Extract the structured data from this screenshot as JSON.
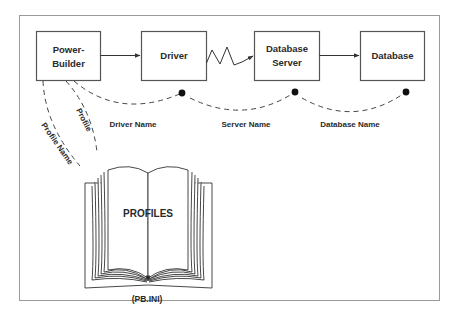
{
  "diagram": {
    "nodes": [
      {
        "id": "powerbuilder",
        "line1": "Power-",
        "line2": "Builder"
      },
      {
        "id": "driver",
        "line1": "Driver"
      },
      {
        "id": "dbserver",
        "line1": "Database",
        "line2": "Server"
      },
      {
        "id": "database",
        "line1": "Database"
      }
    ],
    "connections": [
      {
        "from": "powerbuilder",
        "to": "driver",
        "style": "arrow"
      },
      {
        "from": "driver",
        "to": "dbserver",
        "style": "zigzag-arrow"
      },
      {
        "from": "dbserver",
        "to": "database",
        "style": "arrow"
      }
    ],
    "labels": {
      "driver_name": "Driver Name",
      "server_name": "Server Name",
      "database_name": "Database Name",
      "profile": "Profile",
      "profile_name": "Profile Name"
    },
    "book": {
      "title": "PROFILES",
      "caption": "(PB.INI)"
    }
  }
}
